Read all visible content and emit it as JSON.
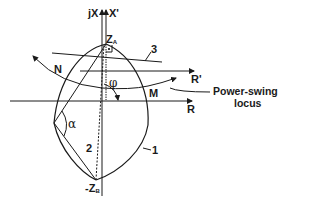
{
  "diagram": {
    "axes": {
      "x_imag_label": "jX",
      "x_imag_prime_label": "X'",
      "r_label": "R",
      "r_prime_label": "R'"
    },
    "points": {
      "za_label": "Z",
      "za_sub": "A",
      "zb_label": "-Z",
      "zb_sub": "B",
      "n_label": "N",
      "m_label": "M"
    },
    "angles": {
      "phi": "φ",
      "alpha": "α"
    },
    "curve_labels": {
      "lens": "1",
      "line_2": "2",
      "line_3": "3"
    },
    "annotation": {
      "line1": "Power-swing",
      "line2": "locus"
    },
    "colors": {
      "ink": "#1a1a1a",
      "background": "#ffffff"
    }
  }
}
